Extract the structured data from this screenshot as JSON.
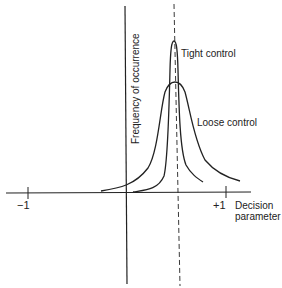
{
  "figure": {
    "y_axis_label": "Frequency of occurrence",
    "x_axis_label_line1": "Decision",
    "x_axis_label_line2": "parameter",
    "tick_minus_one": "−1",
    "tick_plus_one": "+1",
    "curves": [
      {
        "name": "tight-control",
        "label": "Tight control"
      },
      {
        "name": "loose-control",
        "label": "Loose control"
      }
    ],
    "colors": {
      "ink": "#222222",
      "background": "#ffffff"
    }
  }
}
